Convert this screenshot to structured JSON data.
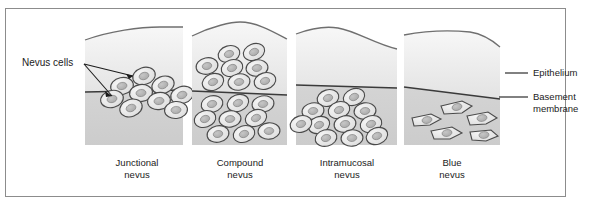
{
  "figure": {
    "frame_color": "#8c8c8c",
    "background": "#ffffff",
    "epithelium_fill_top": "#f4f4f4",
    "epithelium_fill_bottom": "#d8d8d8",
    "dermis_fill_top": "#d2d2d2",
    "dermis_fill_bottom": "#cfcfcf",
    "membrane_color": "#3a3a3a",
    "cell_stroke": "#4a4a4a",
    "cell_fill": "#e9e9e9",
    "nucleus_fill": "#b5b5b5"
  },
  "callouts": {
    "nevus_cells": "Nevus cells",
    "epithelium": "Epithelium",
    "basement_membrane": "Basement\nmembrane"
  },
  "panels": [
    {
      "id": "junctional",
      "label": "Junctional\nnevus",
      "label_line1": "Junctional",
      "label_line2": "nevus",
      "cell_location": "at the epithelial-connective tissue junction",
      "cell_count": 9,
      "cell_shape": "oval"
    },
    {
      "id": "compound",
      "label": "Compound\nnevus",
      "label_line1": "Compound",
      "label_line2": "nevus",
      "cell_location": "both above and below the basement membrane",
      "cell_count": 17,
      "cell_shape": "oval"
    },
    {
      "id": "intramucosal",
      "label": "Intramucosal\nnevus",
      "label_line1": "Intramucosal",
      "label_line2": "nevus",
      "cell_location": "entirely below the basement membrane",
      "cell_count": 12,
      "cell_shape": "oval"
    },
    {
      "id": "blue",
      "label": "Blue\nnevus",
      "label_line1": "Blue",
      "label_line2": "nevus",
      "cell_location": "deep in connective tissue, spindle shaped",
      "cell_count": 5,
      "cell_shape": "spindle"
    }
  ]
}
